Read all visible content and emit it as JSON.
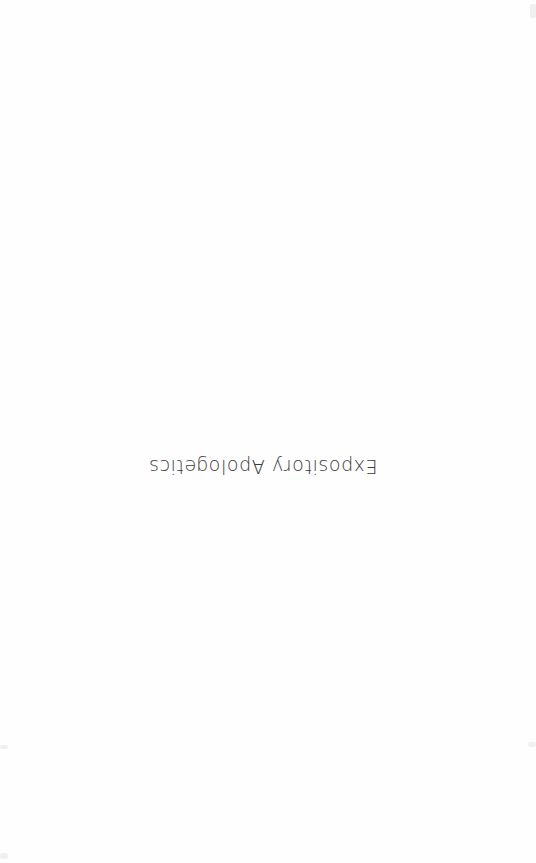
{
  "page": {
    "title": "Expository Apologetics",
    "orientation": "rotated-180",
    "text_color": "#3a3a3a",
    "background_color": "#fefefe"
  }
}
